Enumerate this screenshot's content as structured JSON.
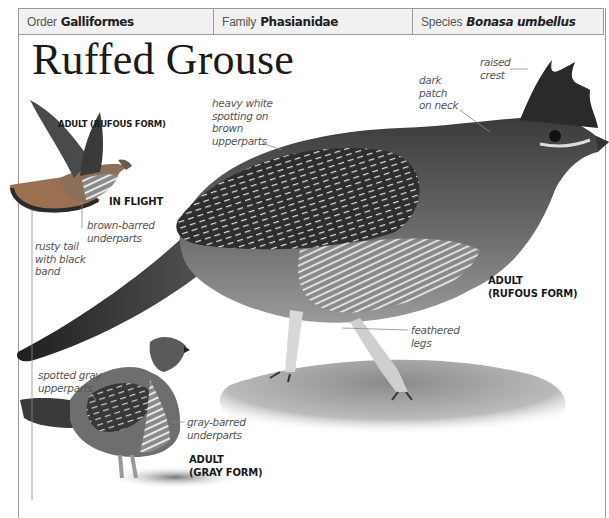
{
  "header": {
    "order": {
      "label": "Order",
      "value": "Galliformes"
    },
    "family": {
      "label": "Family",
      "value": "Phasianidae"
    },
    "species": {
      "label": "Species",
      "value": "Bonasa umbellus"
    }
  },
  "title": "Ruffed Grouse",
  "figures": {
    "flight": {
      "caption_form": "ADULT (RUFOUS FORM)",
      "caption_pose": "IN FLIGHT",
      "notes": {
        "underparts": [
          "brown-barred",
          "underparts"
        ],
        "tail": [
          "rusty tail",
          "with black",
          "band"
        ]
      }
    },
    "rufous": {
      "caption": [
        "ADULT",
        "(RUFOUS FORM)"
      ],
      "notes": {
        "upperparts": [
          "heavy white",
          "spotting on",
          "brown",
          "upperparts"
        ],
        "neck": [
          "dark",
          "patch",
          "on neck"
        ],
        "crest": [
          "raised",
          "crest"
        ],
        "legs": [
          "feathered",
          "legs"
        ]
      }
    },
    "gray": {
      "caption": [
        "ADULT",
        "(GRAY FORM)"
      ],
      "notes": {
        "upperparts": [
          "spotted gray",
          "upperparts"
        ],
        "underparts": [
          "gray-barred",
          "underparts"
        ]
      }
    }
  },
  "colors": {
    "header_bg": "#f1f1f1",
    "border": "#9a9a9a",
    "leader_line": "#8a8a8a",
    "rufous_flight": "#b07a4a"
  }
}
